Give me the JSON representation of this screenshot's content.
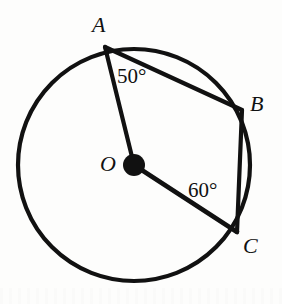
{
  "figure": {
    "type": "circle-geometry-diagram",
    "background_color": "#fdfdfc",
    "stroke_color": "#111111",
    "circle": {
      "center_label": "O",
      "center_x": 134,
      "center_y": 165,
      "radius": 116,
      "stroke_width": 4
    },
    "points": [
      {
        "id": "A",
        "label": "A",
        "x": 105,
        "y": 47
      },
      {
        "id": "B",
        "label": "B",
        "x": 242,
        "y": 110
      },
      {
        "id": "C",
        "label": "C",
        "x": 237,
        "y": 232
      },
      {
        "id": "O",
        "label": "O",
        "x": 134,
        "y": 165
      }
    ],
    "center_dot": {
      "name": "center-point-O",
      "x": 134,
      "y": 165,
      "radius": 11,
      "fill": "#111111"
    },
    "segments": [
      {
        "name": "radius-OA",
        "from": "A",
        "to": "O",
        "kind": "radius"
      },
      {
        "name": "radius-OC",
        "from": "O",
        "to": "C",
        "kind": "radius"
      },
      {
        "name": "chord-AB",
        "from": "A",
        "to": "B",
        "kind": "chord"
      },
      {
        "name": "chord-BC",
        "from": "B",
        "to": "C",
        "kind": "chord"
      }
    ],
    "angles": [
      {
        "name": "angle-at-A",
        "vertex": "A",
        "between": [
          "AO",
          "AB"
        ],
        "value": 50,
        "text": "50°"
      },
      {
        "name": "angle-at-C",
        "vertex": "C",
        "between": [
          "CO",
          "CB"
        ],
        "value": 60,
        "text": "60°"
      }
    ]
  },
  "labels": {
    "A": "A",
    "B": "B",
    "C": "C",
    "O": "O",
    "angle_a": "50°",
    "angle_c": "60°"
  }
}
